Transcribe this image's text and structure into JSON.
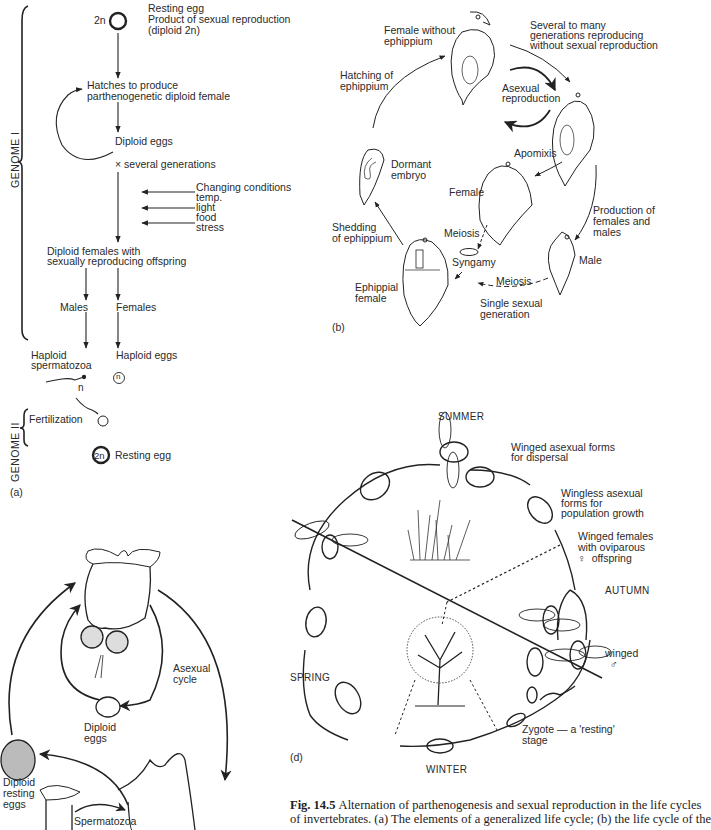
{
  "figure": {
    "caption_label": "Fig. 14.5",
    "caption_lines": [
      "Alternation of parthenogenesis and sexual reproduction in the life cycles",
      "of invertebrates. (a) The elements of a generalized life cycle; (b) the life cycle of the"
    ]
  },
  "panel_a": {
    "label": "(a)",
    "genome1": "GENOME I",
    "genome2": "GENOME II",
    "resting_egg_ploidy": "2n",
    "resting_egg_title": "Resting egg",
    "resting_egg_desc1": "Product of sexual reproduction",
    "resting_egg_desc2": "(diploid 2n)",
    "hatches1": "Hatches to produce",
    "hatches2": "parthenogenetic diploid female",
    "diploid_eggs": "Diploid eggs",
    "generations": "× several generations",
    "conditions": [
      "Changing conditions",
      "temp.",
      "light",
      "food",
      "stress"
    ],
    "diploid_females1": "Diploid females with",
    "diploid_females2": "sexually reproducing offspring",
    "males": "Males",
    "females": "Females",
    "haploid_sperm1": "Haploid",
    "haploid_sperm2": "spermatozoa",
    "haploid_eggs": "Haploid eggs",
    "n_label": "n",
    "n_circle": "n",
    "fertilization": "Fertilization",
    "final_ploidy": "2n",
    "final_egg": "Resting egg"
  },
  "panel_b": {
    "label": "(b)",
    "female_without1": "Female without",
    "female_without2": "ephippium",
    "several1": "Several to many",
    "several2": "generations reproducing",
    "several3": "without sexual reproduction",
    "hatching1": "Hatching of",
    "hatching2": "ephippium",
    "asexual1": "Asexual",
    "asexual2": "reproduction",
    "apomixis": "Apomixis",
    "dormant1": "Dormant",
    "dormant2": "embryo",
    "female": "Female",
    "production1": "Production of",
    "production2": "females and",
    "production3": "males",
    "shedding1": "Shedding",
    "shedding2": "of ephippium",
    "meiosis_left": "Meiosis",
    "syngamy": "Syngamy",
    "male": "Male",
    "ephippial1": "Ephippial",
    "ephippial2": "female",
    "meiosis_bottom": "Meiosis",
    "single1": "Single sexual",
    "single2": "generation"
  },
  "panel_c": {
    "asexual1": "Asexual",
    "asexual2": "cycle",
    "diploid_eggs1": "Diploid",
    "diploid_eggs2": "eggs",
    "resting1": "Diploid",
    "resting2": "resting",
    "resting3": "eggs",
    "spermatozoa": "Spermatozoa"
  },
  "panel_d": {
    "label": "(d)",
    "summer": "SUMMER",
    "autumn": "AUTUMN",
    "winter": "WINTER",
    "spring": "SPRING",
    "winged_asexual1": "Winged asexual forms",
    "winged_asexual2": "for dispersal",
    "wingless1": "Wingless asexual",
    "wingless2": "forms for",
    "wingless3": "population growth",
    "winged_females1": "Winged females",
    "winged_females2": "with oviparous",
    "winged_females3": "♀  offspring",
    "winged_male1": "winged",
    "winged_male2": "♂",
    "zygote1": "Zygote — a 'resting'",
    "zygote2": "stage"
  }
}
